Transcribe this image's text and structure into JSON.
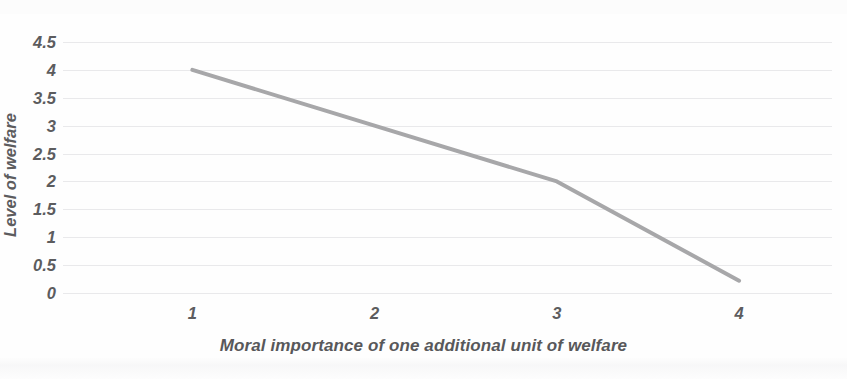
{
  "chart_data": {
    "type": "line",
    "title": "",
    "xlabel": "Moral importance of one additional unit of welfare",
    "ylabel": "Level of welfare",
    "x": [
      1,
      3,
      4
    ],
    "values": [
      4,
      2,
      0.22
    ],
    "series": [
      {
        "name": "Level of welfare",
        "x": [
          1,
          3,
          4
        ],
        "values": [
          4,
          2,
          0.22
        ],
        "color": "#a7a7a9"
      }
    ],
    "xlim": [
      0.29,
      4.51
    ],
    "ylim": [
      0,
      4.5
    ],
    "x_ticks": [
      "1",
      "2",
      "3",
      "4"
    ],
    "x_tick_values": [
      1,
      2,
      3,
      4
    ],
    "y_ticks": [
      "0",
      "0.5",
      "1",
      "1.5",
      "2",
      "2.5",
      "3",
      "3.5",
      "4",
      "4.5"
    ],
    "y_tick_values": [
      0,
      0.5,
      1,
      1.5,
      2,
      2.5,
      3,
      3.5,
      4,
      4.5
    ],
    "grid": "horizontal",
    "legend": "none",
    "annotations": [],
    "colors": {
      "line": "#a7a7a9",
      "gridline": "#e9e9eb",
      "text": "#5c5c5e",
      "background": "#fefefe"
    }
  }
}
